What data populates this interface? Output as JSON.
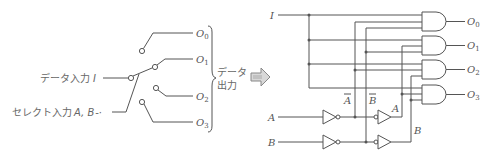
{
  "switch_diagram": {
    "data_input_label": "データ入力",
    "data_input_var": "I",
    "select_input_label": "セレクト入力",
    "select_input_vars": "A, B",
    "outputs": [
      {
        "letter": "O",
        "sub": "0"
      },
      {
        "letter": "O",
        "sub": "1"
      },
      {
        "letter": "O",
        "sub": "2"
      },
      {
        "letter": "O",
        "sub": "3"
      }
    ],
    "output_group_label_line1": "データ",
    "output_group_label_line2": "出力"
  },
  "arrow": {
    "icon": "right-arrow-icon"
  },
  "logic_circuit": {
    "input_I": "I",
    "input_A": "A",
    "input_B": "B",
    "label_A_bar": "A",
    "label_B_bar": "B",
    "label_A": "A",
    "label_B": "B",
    "outputs": [
      {
        "letter": "O",
        "sub": "0"
      },
      {
        "letter": "O",
        "sub": "1"
      },
      {
        "letter": "O",
        "sub": "2"
      },
      {
        "letter": "O",
        "sub": "3"
      }
    ]
  },
  "colors": {
    "line": "#555555",
    "arrow_fill": "#d8d8d8",
    "background": "#ffffff"
  }
}
